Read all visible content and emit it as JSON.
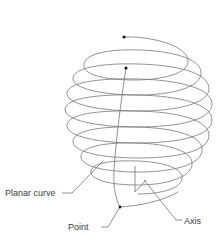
{
  "diagram": {
    "labels": {
      "planar_curve": "Planar curve",
      "point": "Point",
      "axis": "Axis"
    },
    "colors": {
      "stroke": "#6e6e6e",
      "dot": "#1a1a1a",
      "text": "#3a3a3a",
      "background": "#ffffff"
    }
  }
}
